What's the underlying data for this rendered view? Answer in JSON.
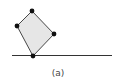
{
  "figure": {
    "caption": "(a)",
    "shape": {
      "type": "tilted-rectangle",
      "fill": "#e6e6e6",
      "stroke": "#333333",
      "vertices": [
        [
          32,
          11
        ],
        [
          17,
          26
        ],
        [
          33,
          56
        ],
        [
          54,
          34
        ]
      ]
    },
    "vertex_color": "#111111",
    "ground_line": {
      "x1": 12,
      "y1": 55.5,
      "x2": 112,
      "y2": 55.5,
      "color": "#333333"
    }
  }
}
